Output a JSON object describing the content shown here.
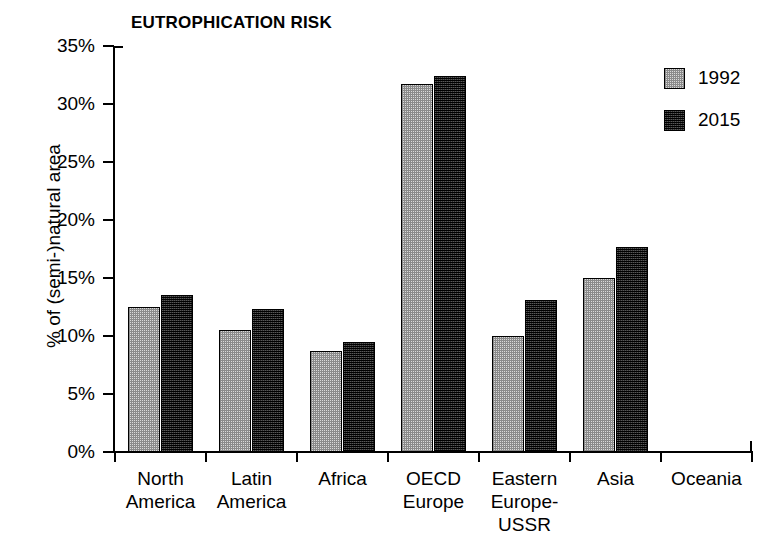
{
  "chart_data": {
    "type": "bar",
    "title": "EUTROPHICATION RISK",
    "xlabel": "",
    "ylabel": "% of (semi-)natural area",
    "categories": [
      "North America",
      "Latin America",
      "Africa",
      "OECD Europe",
      "Eastern Europe-USSR",
      "Asia",
      "Oceania"
    ],
    "category_lines": [
      [
        "North",
        "America"
      ],
      [
        "Latin",
        "America"
      ],
      [
        "Africa"
      ],
      [
        "OECD",
        "Europe"
      ],
      [
        "Eastern",
        "Europe-",
        "USSR"
      ],
      [
        "Asia"
      ],
      [
        "Oceania"
      ]
    ],
    "series": [
      {
        "name": "1992",
        "color": "#d9d9d9",
        "values": [
          12.5,
          10.5,
          8.7,
          31.7,
          10.0,
          15.0,
          0.0
        ]
      },
      {
        "name": "2015",
        "color": "#2b2b2b",
        "values": [
          13.5,
          12.3,
          9.5,
          32.4,
          13.1,
          17.7,
          0.0
        ]
      }
    ],
    "ylim": [
      0,
      35
    ],
    "ytick_values": [
      0,
      5,
      10,
      15,
      20,
      25,
      30,
      35
    ],
    "ytick_labels": [
      "0%",
      "5%",
      "10%",
      "15%",
      "20%",
      "25%",
      "30%",
      "35%"
    ],
    "grid": false,
    "legend_position": "top-right"
  },
  "legend": {
    "entries": [
      {
        "label": "1992"
      },
      {
        "label": "2015"
      }
    ]
  }
}
